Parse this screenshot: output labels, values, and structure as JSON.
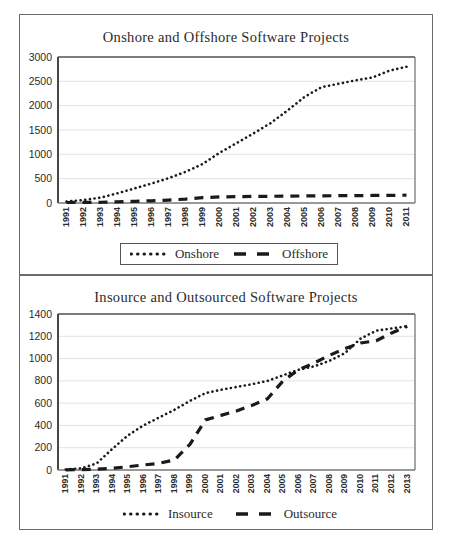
{
  "page": {
    "background": "#ffffff",
    "ink": "#1a1a1a"
  },
  "charts": [
    {
      "id": "onshore-offshore",
      "title": "Onshore and Offshore Software Projects",
      "legend": {
        "boxed": true,
        "entries": [
          {
            "label": "Onshore",
            "style": "dotted"
          },
          {
            "label": "Offshore",
            "style": "dashed"
          }
        ]
      }
    },
    {
      "id": "insource-outsource",
      "title": "Insource and Outsourced Software Projects",
      "legend": {
        "boxed": false,
        "entries": [
          {
            "label": "Insource",
            "style": "dotted"
          },
          {
            "label": "Outsource",
            "style": "dashed"
          }
        ]
      }
    }
  ],
  "chart_data": [
    {
      "type": "line",
      "id": "onshore-offshore",
      "title": "Onshore and Offshore Software Projects",
      "xlabel": "",
      "ylabel": "",
      "ylim": [
        0,
        3000
      ],
      "yticks": [
        0,
        500,
        1000,
        1500,
        2000,
        2500,
        3000
      ],
      "ytick_labels": [
        "0",
        "500",
        "1000",
        "1500",
        "2000",
        "2500",
        "3000"
      ],
      "grid": true,
      "grid_axis": "y",
      "legend_position": "bottom",
      "categories": [
        "1991",
        "1992",
        "1993",
        "1994",
        "1995",
        "1996",
        "1997",
        "1998",
        "1999",
        "2000",
        "2001",
        "2002",
        "2003",
        "2004",
        "2005",
        "2006",
        "2007",
        "2008",
        "2009",
        "2010",
        "2011"
      ],
      "x": [
        1991,
        1992,
        1993,
        1994,
        1995,
        1996,
        1997,
        1998,
        1999,
        2000,
        2001,
        2002,
        2003,
        2004,
        2005,
        2006,
        2007,
        2008,
        2009,
        2010,
        2011
      ],
      "series": [
        {
          "name": "Onshore",
          "style": "dotted",
          "color": "#1a1a1a",
          "values": [
            30,
            60,
            110,
            200,
            300,
            400,
            510,
            640,
            800,
            1030,
            1230,
            1430,
            1640,
            1900,
            2180,
            2380,
            2450,
            2520,
            2580,
            2720,
            2800
          ]
        },
        {
          "name": "Offshore",
          "style": "dashed",
          "color": "#1a1a1a",
          "values": [
            10,
            12,
            15,
            25,
            35,
            45,
            60,
            80,
            110,
            125,
            130,
            135,
            138,
            140,
            145,
            148,
            150,
            152,
            155,
            158,
            160
          ]
        }
      ]
    },
    {
      "type": "line",
      "id": "insource-outsource",
      "title": "Insource and Outsourced Software Projects",
      "xlabel": "",
      "ylabel": "",
      "ylim": [
        0,
        1400
      ],
      "yticks": [
        0,
        200,
        400,
        600,
        800,
        1000,
        1200,
        1400
      ],
      "ytick_labels": [
        "0",
        "200",
        "400",
        "600",
        "800",
        "1000",
        "1200",
        "1400"
      ],
      "grid": true,
      "grid_axis": "y",
      "legend_position": "bottom",
      "categories": [
        "1991",
        "1992",
        "1993",
        "1994",
        "1995",
        "1996",
        "1997",
        "1998",
        "1999",
        "2000",
        "2001",
        "2002",
        "2003",
        "2004",
        "2005",
        "2006",
        "2007",
        "2008",
        "2009",
        "2010",
        "2011",
        "2012",
        "2013"
      ],
      "x": [
        1991,
        1992,
        1993,
        1994,
        1995,
        1996,
        1997,
        1998,
        1999,
        2000,
        2001,
        2002,
        2003,
        2004,
        2005,
        2006,
        2007,
        2008,
        2009,
        2010,
        2011,
        2012,
        2013
      ],
      "series": [
        {
          "name": "Insource",
          "style": "dotted",
          "color": "#1a1a1a",
          "values": [
            5,
            15,
            60,
            190,
            310,
            400,
            470,
            540,
            620,
            690,
            720,
            745,
            770,
            800,
            850,
            900,
            930,
            980,
            1050,
            1180,
            1250,
            1270,
            1290
          ]
        },
        {
          "name": "Outsource",
          "style": "dashed",
          "color": "#1a1a1a",
          "values": [
            2,
            4,
            8,
            15,
            30,
            45,
            60,
            90,
            230,
            450,
            490,
            530,
            580,
            640,
            800,
            900,
            960,
            1030,
            1090,
            1140,
            1160,
            1230,
            1290
          ]
        }
      ]
    }
  ]
}
